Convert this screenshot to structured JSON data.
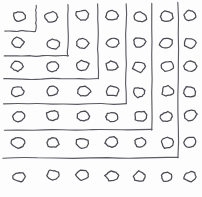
{
  "figure": {
    "style": "hand-drawn monochrome line sketch",
    "background_color": "#fdfdfd",
    "stroke_color": "#4a4a52",
    "line_color": "#5b5b63",
    "width": 202,
    "height": 197
  },
  "grid": {
    "rows": 7,
    "columns": 7,
    "total_dots": 49,
    "dot_shape": "ellipse",
    "dot_radius_x": 6.2,
    "dot_radius_y": 5.0,
    "column_x": [
      18,
      52,
      83,
      112,
      140,
      167,
      190
    ],
    "row_y": [
      16,
      43,
      66,
      91,
      116,
      142,
      176
    ]
  },
  "corners": [
    {
      "index": 1,
      "vertical_x": 36,
      "vertical_top": 5,
      "corner_y": 31,
      "horizontal_left": 5,
      "label": "innermost-corner"
    },
    {
      "index": 2,
      "vertical_x": 68,
      "vertical_top": 4,
      "corner_y": 56,
      "horizontal_left": 4,
      "label": "corner-2"
    },
    {
      "index": 3,
      "vertical_x": 98,
      "vertical_top": 4,
      "corner_y": 79,
      "horizontal_left": 4,
      "label": "corner-3"
    },
    {
      "index": 4,
      "vertical_x": 126,
      "vertical_top": 4,
      "corner_y": 104,
      "horizontal_left": 4,
      "label": "corner-4"
    },
    {
      "index": 5,
      "vertical_x": 152,
      "vertical_top": 4,
      "corner_y": 130,
      "horizontal_left": 4,
      "label": "corner-5"
    },
    {
      "index": 6,
      "vertical_x": 178,
      "vertical_top": 3,
      "corner_y": 158,
      "horizontal_left": 3,
      "label": "outermost-corner"
    }
  ],
  "chart_data": {
    "type": "scatter",
    "xlabel": "",
    "ylabel": "",
    "grid": false,
    "legend": "none",
    "categories": [
      "c1",
      "c2",
      "c3",
      "c4",
      "c5",
      "c6",
      "c7"
    ],
    "x": [
      1,
      2,
      3,
      4,
      5,
      6,
      7
    ],
    "y": [
      1,
      2,
      3,
      4,
      5,
      6,
      7
    ],
    "series": [
      {
        "name": "row-1",
        "values": [
          1,
          1,
          1,
          1,
          1,
          1,
          1
        ]
      },
      {
        "name": "row-2",
        "values": [
          2,
          2,
          2,
          2,
          2,
          2,
          2
        ]
      },
      {
        "name": "row-3",
        "values": [
          3,
          3,
          3,
          3,
          3,
          3,
          3
        ]
      },
      {
        "name": "row-4",
        "values": [
          4,
          4,
          4,
          4,
          4,
          4,
          4
        ]
      },
      {
        "name": "row-5",
        "values": [
          5,
          5,
          5,
          5,
          5,
          5,
          5
        ]
      },
      {
        "name": "row-6",
        "values": [
          6,
          6,
          6,
          6,
          6,
          6,
          6
        ]
      },
      {
        "name": "row-7",
        "values": [
          7,
          7,
          7,
          7,
          7,
          7,
          7
        ]
      }
    ],
    "annotations": [
      "six nested right-angle corner polylines",
      "corner k separates the first k rows/columns from the rest"
    ]
  }
}
